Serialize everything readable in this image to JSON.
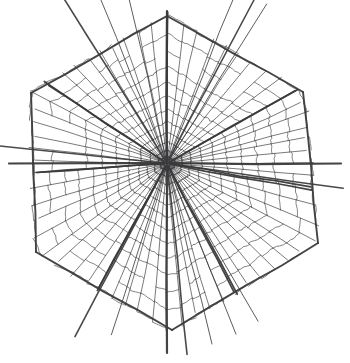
{
  "figure": {
    "type": "line-drawing",
    "canvas": {
      "width": 350,
      "height": 363,
      "background": "#ffffff"
    },
    "style": {
      "ink_color": "#3a3a3c",
      "ink_color_light": "#6b6b70",
      "ink_color_dark": "#1f1f22",
      "stroke_width_spoke_major": 1.7,
      "stroke_width_spoke_minor": 0.85,
      "stroke_width_cross": 0.8,
      "stroke_width_boundary": 1.9
    },
    "center": {
      "x": 167,
      "y": 163.5
    },
    "axes": {
      "vertical_spoke": {
        "label": "vertical-axis",
        "top_y": 11,
        "bottom_y": 353
      },
      "horizontal_spoke": {
        "label": "horizontal-axis",
        "left_x": 9,
        "right_x": 341
      }
    },
    "hexagon": {
      "label": "outer-boundary-hexagon",
      "vertices": [
        {
          "x": 167,
          "y": 16
        },
        {
          "x": 303,
          "y": 92
        },
        {
          "x": 318,
          "y": 243
        },
        {
          "x": 172,
          "y": 330
        },
        {
          "x": 36,
          "y": 252
        },
        {
          "x": 31,
          "y": 93
        }
      ]
    },
    "sectors": [
      {
        "id": "sector-n-ne",
        "start_angle_deg": -90,
        "end_angle_deg": -30,
        "spoke_count": 9,
        "ring_count": 13,
        "reach": 152
      },
      {
        "id": "sector-ne-e",
        "start_angle_deg": -30,
        "end_angle_deg": 10,
        "spoke_count": 8,
        "ring_count": 12,
        "reach": 160
      },
      {
        "id": "sector-e-se",
        "start_angle_deg": 10,
        "end_angle_deg": 62,
        "spoke_count": 9,
        "ring_count": 13,
        "reach": 158
      },
      {
        "id": "sector-se-s",
        "start_angle_deg": 62,
        "end_angle_deg": 118,
        "spoke_count": 10,
        "ring_count": 14,
        "reach": 172
      },
      {
        "id": "sector-s-sw",
        "start_angle_deg": 118,
        "end_angle_deg": 176,
        "spoke_count": 9,
        "ring_count": 13,
        "reach": 160
      },
      {
        "id": "sector-sw-w",
        "start_angle_deg": 176,
        "end_angle_deg": 214,
        "spoke_count": 7,
        "ring_count": 11,
        "reach": 150
      },
      {
        "id": "sector-w-nw",
        "start_angle_deg": 214,
        "end_angle_deg": 270,
        "spoke_count": 9,
        "ring_count": 13,
        "reach": 152
      }
    ],
    "overshoot_spokes": [
      {
        "angle_deg": -122,
        "length": 196,
        "weight": 1.6
      },
      {
        "angle_deg": -112,
        "length": 180,
        "weight": 0.9
      },
      {
        "angle_deg": -103,
        "length": 175,
        "weight": 0.9
      },
      {
        "angle_deg": -68,
        "length": 186,
        "weight": 0.9
      },
      {
        "angle_deg": -62,
        "length": 190,
        "weight": 1.5
      },
      {
        "angle_deg": -58,
        "length": 188,
        "weight": 0.9
      },
      {
        "angle_deg": 186,
        "length": 172,
        "weight": 1.5
      },
      {
        "angle_deg": 8,
        "length": 178,
        "weight": 1.5
      },
      {
        "angle_deg": 118,
        "length": 196,
        "weight": 1.6
      },
      {
        "angle_deg": 108,
        "length": 180,
        "weight": 0.9
      },
      {
        "angle_deg": 84,
        "length": 192,
        "weight": 1.6
      },
      {
        "angle_deg": 76,
        "length": 186,
        "weight": 0.9
      },
      {
        "angle_deg": 68,
        "length": 184,
        "weight": 0.9
      },
      {
        "angle_deg": 60,
        "length": 182,
        "weight": 0.9
      }
    ]
  }
}
